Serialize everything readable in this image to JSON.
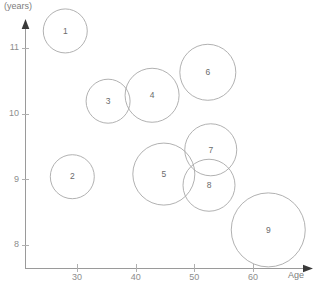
{
  "chart_data": {
    "type": "scatter",
    "title": "",
    "subtitle": "",
    "xlabel": "Age",
    "ylabel": "(years)",
    "xlim": [
      22.3,
      70.9
    ],
    "ylim": [
      7.65,
      11.35
    ],
    "xticks": [
      30,
      40,
      50,
      60
    ],
    "xtick_labels": [
      "30",
      "40",
      "50",
      "60"
    ],
    "yticks": [
      8,
      9,
      10,
      11
    ],
    "ytick_labels": [
      "8",
      "9",
      "10",
      "11"
    ],
    "grid": false,
    "legend": "none",
    "bubble_outline_color": "#a8a8a8",
    "axis_color": "#9a9a9a",
    "label_color": "#8d8d8d",
    "points": [
      {
        "label": "1",
        "x": 28.0,
        "y": 11.26,
        "r_px": 22
      },
      {
        "label": "2",
        "x": 29.2,
        "y": 9.04,
        "r_px": 22
      },
      {
        "label": "3",
        "x": 35.3,
        "y": 10.19,
        "r_px": 22
      },
      {
        "label": "4",
        "x": 42.8,
        "y": 10.28,
        "r_px": 27
      },
      {
        "label": "5",
        "x": 44.8,
        "y": 9.08,
        "r_px": 31
      },
      {
        "label": "6",
        "x": 52.3,
        "y": 10.63,
        "r_px": 28
      },
      {
        "label": "7",
        "x": 52.8,
        "y": 9.45,
        "r_px": 26
      },
      {
        "label": "8",
        "x": 52.5,
        "y": 8.91,
        "r_px": 26
      },
      {
        "label": "9",
        "x": 62.6,
        "y": 8.23,
        "r_px": 37
      }
    ]
  }
}
